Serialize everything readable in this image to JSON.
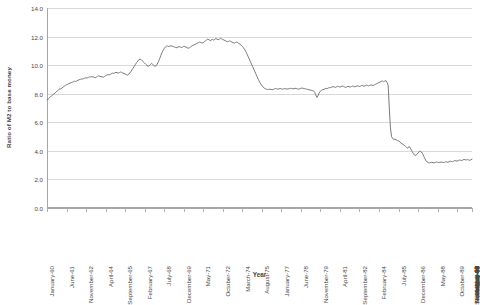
{
  "chart_data": {
    "type": "line",
    "title": "",
    "xlabel": "Year",
    "ylabel": "Ratio of M2 to base money",
    "ylim": [
      0.0,
      14.0
    ],
    "ytick_step": 2.0,
    "ytick_labels": [
      "14.0",
      "12.0",
      "10.0",
      "8.0",
      "6.0",
      "4.0",
      "2.0",
      "0.0"
    ],
    "ytick_values": [
      14.0,
      12.0,
      10.0,
      8.0,
      6.0,
      4.0,
      2.0,
      0.0
    ],
    "grid": true,
    "legend": "none",
    "line_color": "#6b6b6b",
    "xtick_labels": [
      "January-60",
      "June-61",
      "November-62",
      "April-64",
      "September-65",
      "February-67",
      "July-68",
      "December-69",
      "May-71",
      "October-72",
      "March-74",
      "August-75",
      "January-77",
      "June-78",
      "November-79",
      "April-81",
      "September-82",
      "February-84",
      "July-85",
      "December-86",
      "May-88",
      "October-89",
      "March-91",
      "August-92",
      "January-94",
      "June-95",
      "November-96",
      "April-98",
      "September-99",
      "February-01",
      "July-02",
      "December-03",
      "May-05",
      "October-06",
      "March-08",
      "August-09",
      "January-11",
      "June-12",
      "November-13",
      "April-15"
    ],
    "x_start": "January-60",
    "x_end": "April-15",
    "x_interval_months": 17,
    "series": [
      {
        "name": "Ratio of M2 to base money",
        "x_unit": "months since January-60",
        "values": [
          7.58,
          7.62,
          7.7,
          7.78,
          7.86,
          7.92,
          7.98,
          8.05,
          8.12,
          8.2,
          8.28,
          8.33,
          8.34,
          8.39,
          8.46,
          8.52,
          8.58,
          8.63,
          8.66,
          8.7,
          8.74,
          8.78,
          8.8,
          8.84,
          8.88,
          8.86,
          8.89,
          8.94,
          8.98,
          9.0,
          9.04,
          9.02,
          9.06,
          9.1,
          9.12,
          9.1,
          9.14,
          9.18,
          9.16,
          9.2,
          9.18,
          9.15,
          9.12,
          9.16,
          9.22,
          9.25,
          9.22,
          9.2,
          9.18,
          9.16,
          9.2,
          9.26,
          9.3,
          9.34,
          9.31,
          9.35,
          9.4,
          9.44,
          9.42,
          9.46,
          9.5,
          9.47,
          9.44,
          9.48,
          9.52,
          9.49,
          9.45,
          9.42,
          9.38,
          9.34,
          9.3,
          9.35,
          9.45,
          9.55,
          9.68,
          9.8,
          9.92,
          10.05,
          10.18,
          10.28,
          10.38,
          10.42,
          10.38,
          10.3,
          10.22,
          10.14,
          10.06,
          9.98,
          9.92,
          9.96,
          10.04,
          10.12,
          10.05,
          9.98,
          9.92,
          9.96,
          10.08,
          10.24,
          10.44,
          10.66,
          10.86,
          11.02,
          11.16,
          11.26,
          11.32,
          11.34,
          11.3,
          11.33,
          11.36,
          11.33,
          11.3,
          11.27,
          11.24,
          11.22,
          11.26,
          11.3,
          11.27,
          11.24,
          11.26,
          11.32,
          11.3,
          11.26,
          11.22,
          11.18,
          11.22,
          11.28,
          11.34,
          11.38,
          11.42,
          11.46,
          11.5,
          11.54,
          11.58,
          11.62,
          11.58,
          11.54,
          11.58,
          11.64,
          11.7,
          11.76,
          11.82,
          11.78,
          11.72,
          11.76,
          11.8,
          11.76,
          11.8,
          11.86,
          11.82,
          11.78,
          11.82,
          11.88,
          11.84,
          11.8,
          11.76,
          11.72,
          11.68,
          11.64,
          11.66,
          11.7,
          11.66,
          11.62,
          11.58,
          11.54,
          11.58,
          11.62,
          11.58,
          11.52,
          11.46,
          11.4,
          11.32,
          11.22,
          11.1,
          10.96,
          10.8,
          10.62,
          10.44,
          10.26,
          10.08,
          9.9,
          9.72,
          9.54,
          9.36,
          9.18,
          9.0,
          8.84,
          8.7,
          8.58,
          8.48,
          8.4,
          8.34,
          8.32,
          8.3,
          8.3,
          8.32,
          8.3,
          8.28,
          8.3,
          8.34,
          8.36,
          8.34,
          8.32,
          8.34,
          8.36,
          8.34,
          8.32,
          8.34,
          8.36,
          8.34,
          8.32,
          8.34,
          8.36,
          8.38,
          8.36,
          8.34,
          8.36,
          8.38,
          8.36,
          8.34,
          8.32,
          8.34,
          8.38,
          8.4,
          8.38,
          8.36,
          8.34,
          8.32,
          8.3,
          8.28,
          8.26,
          8.24,
          8.22,
          8.2,
          8.1,
          7.92,
          7.74,
          7.88,
          8.06,
          8.18,
          8.24,
          8.28,
          8.3,
          8.34,
          8.38,
          8.36,
          8.4,
          8.44,
          8.42,
          8.46,
          8.5,
          8.48,
          8.44,
          8.48,
          8.52,
          8.5,
          8.46,
          8.5,
          8.54,
          8.52,
          8.48,
          8.44,
          8.48,
          8.52,
          8.5,
          8.46,
          8.5,
          8.54,
          8.52,
          8.48,
          8.52,
          8.56,
          8.54,
          8.5,
          8.54,
          8.58,
          8.56,
          8.52,
          8.56,
          8.6,
          8.58,
          8.54,
          8.58,
          8.62,
          8.6,
          8.58,
          8.62,
          8.66,
          8.7,
          8.74,
          8.78,
          8.82,
          8.86,
          8.9,
          8.84,
          8.88,
          8.92,
          8.8,
          8.6,
          7.0,
          5.6,
          5.0,
          4.85,
          4.8,
          4.82,
          4.78,
          4.72,
          4.7,
          4.65,
          4.55,
          4.5,
          4.45,
          4.4,
          4.32,
          4.24,
          4.18,
          4.3,
          4.25,
          4.1,
          3.95,
          3.8,
          3.7,
          3.68,
          3.75,
          3.85,
          3.95,
          3.98,
          3.92,
          3.8,
          3.62,
          3.45,
          3.3,
          3.22,
          3.18,
          3.16,
          3.18,
          3.2,
          3.18,
          3.16,
          3.18,
          3.22,
          3.2,
          3.18,
          3.2,
          3.22,
          3.2,
          3.18,
          3.2,
          3.24,
          3.22,
          3.2,
          3.24,
          3.28,
          3.26,
          3.24,
          3.28,
          3.32,
          3.3,
          3.28,
          3.32,
          3.36,
          3.34,
          3.32,
          3.36,
          3.4,
          3.38,
          3.36,
          3.4,
          3.36,
          3.34,
          3.38,
          3.42
        ]
      }
    ]
  }
}
